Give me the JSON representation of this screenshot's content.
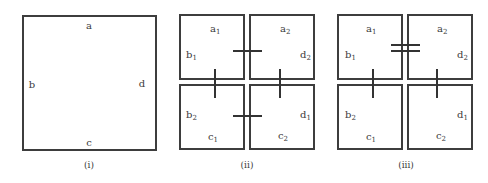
{
  "panels": [
    {
      "caption": "(i)",
      "labels": {
        "top": "a",
        "left": "b",
        "right": "d",
        "bottom": "c"
      }
    },
    {
      "caption": "(ii)",
      "boxes": {
        "top_left": {
          "top": "a",
          "top_sub": "1",
          "left": "b",
          "left_sub": "1"
        },
        "top_right": {
          "top": "a",
          "top_sub": "2",
          "right": "d",
          "right_sub": "2"
        },
        "bottom_left": {
          "left": "b",
          "left_sub": "2",
          "bottom": "c",
          "bottom_sub": "1"
        },
        "bottom_right": {
          "right": "d",
          "right_sub": "1",
          "bottom": "c",
          "bottom_sub": "2"
        }
      },
      "connectors": [
        "single-tick top",
        "single-tick left",
        "single-tick right",
        "single-tick bottom"
      ]
    },
    {
      "caption": "(iii)",
      "boxes": {
        "top_left": {
          "top": "a",
          "top_sub": "1",
          "left": "b",
          "left_sub": "1"
        },
        "top_right": {
          "top": "a",
          "top_sub": "2",
          "right": "d",
          "right_sub": "2"
        },
        "bottom_left": {
          "left": "b",
          "left_sub": "2",
          "bottom": "c",
          "bottom_sub": "1"
        },
        "bottom_right": {
          "right": "d",
          "right_sub": "1",
          "bottom": "c",
          "bottom_sub": "2"
        }
      },
      "connectors": [
        "double-tick top",
        "single-tick left",
        "single-tick right"
      ]
    }
  ]
}
